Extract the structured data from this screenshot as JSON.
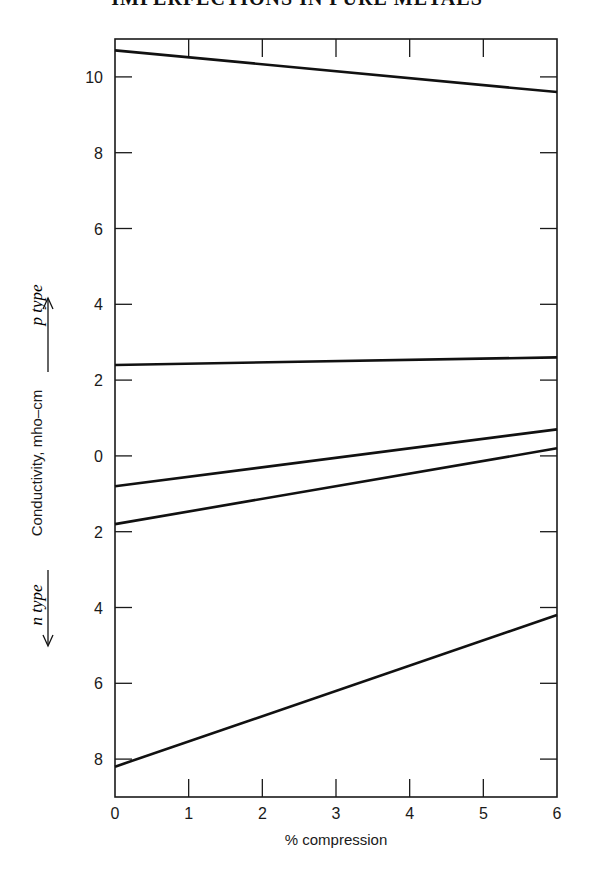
{
  "page": {
    "header": "IMPERFECTIONS IN PURE METALS"
  },
  "chart_data": {
    "type": "line",
    "title": "",
    "xlabel": "% compression",
    "ylabel": "Conductivity, mho–cm",
    "xlim": [
      0,
      6
    ],
    "ylim": [
      -9,
      11
    ],
    "x_ticks": [
      0,
      1,
      2,
      3,
      4,
      5,
      6
    ],
    "y_ticks": [
      {
        "value": 10,
        "label": "10"
      },
      {
        "value": 8,
        "label": "8"
      },
      {
        "value": 6,
        "label": "6"
      },
      {
        "value": 4,
        "label": "4"
      },
      {
        "value": 2,
        "label": "2"
      },
      {
        "value": 0,
        "label": "0"
      },
      {
        "value": -2,
        "label": "2"
      },
      {
        "value": -4,
        "label": "4"
      },
      {
        "value": -6,
        "label": "6"
      },
      {
        "value": -8,
        "label": "8"
      }
    ],
    "annotations": [
      {
        "text": "p type",
        "direction": "up",
        "meaning": "positive values = p-type conductivity"
      },
      {
        "text": "n type",
        "direction": "down",
        "meaning": "negative values = n-type conductivity"
      }
    ],
    "grid": false,
    "legend": null,
    "series": [
      {
        "name": "line 1",
        "x": [
          0,
          6
        ],
        "y": [
          10.7,
          9.6
        ]
      },
      {
        "name": "line 2",
        "x": [
          0,
          6
        ],
        "y": [
          2.4,
          2.6
        ]
      },
      {
        "name": "line 3",
        "x": [
          0,
          6
        ],
        "y": [
          -0.8,
          0.7
        ]
      },
      {
        "name": "line 4",
        "x": [
          0,
          6
        ],
        "y": [
          -1.8,
          0.2
        ]
      },
      {
        "name": "line 5",
        "x": [
          0,
          6
        ],
        "y": [
          -8.2,
          -4.2
        ]
      }
    ]
  }
}
